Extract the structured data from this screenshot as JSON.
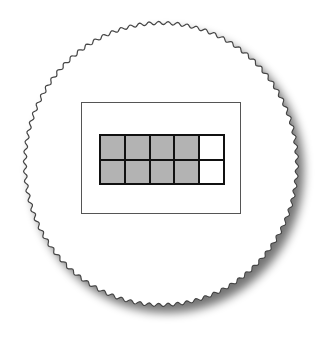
{
  "diagram": {
    "type": "ten-frame",
    "rows": 2,
    "columns": 5,
    "filled_count": 8,
    "empty_count": 2,
    "cells": [
      {
        "row": 1,
        "col": 1,
        "filled": true
      },
      {
        "row": 1,
        "col": 2,
        "filled": true
      },
      {
        "row": 1,
        "col": 3,
        "filled": true
      },
      {
        "row": 1,
        "col": 4,
        "filled": true
      },
      {
        "row": 1,
        "col": 5,
        "filled": false
      },
      {
        "row": 2,
        "col": 1,
        "filled": true
      },
      {
        "row": 2,
        "col": 2,
        "filled": true
      },
      {
        "row": 2,
        "col": 3,
        "filled": true
      },
      {
        "row": 2,
        "col": 4,
        "filled": true
      },
      {
        "row": 2,
        "col": 5,
        "filled": false
      }
    ],
    "colors": {
      "filled": "#b3b3b3",
      "empty": "#ffffff",
      "grid_lines": "#111111",
      "plate_edge": "#444444",
      "shadow": "#888888"
    }
  }
}
